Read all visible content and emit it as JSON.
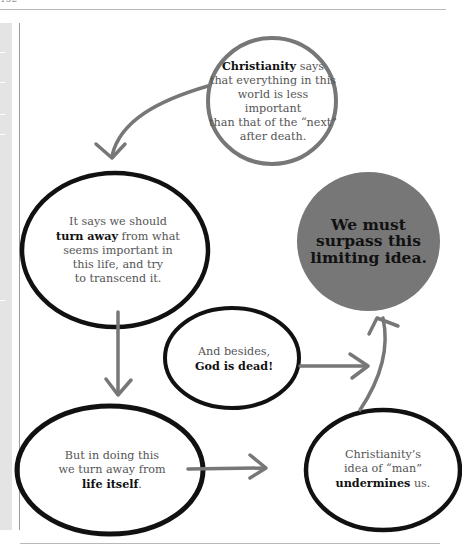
{
  "page": {
    "page_number": "152",
    "colors": {
      "ink": "#111111",
      "text": "#555555",
      "arrow": "#777777",
      "goal_fill": "#777777",
      "sidebar": "#e4e4e4",
      "rule": "#b8b8b8"
    }
  },
  "diagram": {
    "nodes": [
      {
        "id": "christianity-says",
        "outline": "gray",
        "lines": [
          {
            "bold": "Christianity",
            "rest": " says"
          },
          {
            "bold": "",
            "rest": "that everything in this"
          },
          {
            "bold": "",
            "rest": "world is less important"
          },
          {
            "bold": "",
            "rest": "than that of the “next”"
          },
          {
            "bold": "",
            "rest": "after death."
          }
        ]
      },
      {
        "id": "turn-away",
        "outline": "black",
        "lines": [
          {
            "bold": "",
            "rest": "It says we should"
          },
          {
            "bold": "turn away",
            "rest": " from what"
          },
          {
            "bold": "",
            "rest": "seems important in"
          },
          {
            "bold": "",
            "rest": "this life, and try"
          },
          {
            "bold": "",
            "rest": "to transcend it."
          }
        ]
      },
      {
        "id": "god-is-dead",
        "outline": "black",
        "lines": [
          {
            "bold": "",
            "rest": "And besides,"
          },
          {
            "bold": "God is dead!",
            "rest": ""
          }
        ]
      },
      {
        "id": "life-itself",
        "outline": "black",
        "lines": [
          {
            "bold": "",
            "rest": "But in doing this"
          },
          {
            "bold": "",
            "rest": "we turn away from"
          },
          {
            "bold": "life itself",
            "rest": "."
          }
        ]
      },
      {
        "id": "undermines",
        "outline": "black",
        "lines": [
          {
            "bold": "",
            "rest": "Christianity’s"
          },
          {
            "bold": "",
            "rest": "idea of “man”"
          },
          {
            "bold": "undermines",
            "rest": " us."
          }
        ]
      }
    ],
    "goal": {
      "id": "surpass",
      "lines": [
        "We must",
        "surpass this",
        "limiting idea."
      ]
    },
    "arrows": [
      {
        "from": "christianity-says",
        "to": "turn-away",
        "shape": "curved"
      },
      {
        "from": "turn-away",
        "to": "life-itself",
        "shape": "straight-down"
      },
      {
        "from": "life-itself",
        "to": "undermines",
        "shape": "straight-right"
      },
      {
        "from": "god-is-dead",
        "to": "surpass",
        "shape": "straight-right"
      },
      {
        "from": "undermines",
        "to": "surpass",
        "shape": "curved-up"
      }
    ]
  }
}
